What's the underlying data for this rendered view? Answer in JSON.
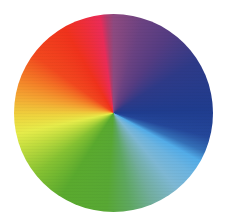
{
  "image": {
    "description": "Conic color wheel",
    "background_color": "#ffffff"
  },
  "wheel": {
    "shape": "circle",
    "center": [
      114,
      113
    ],
    "diameter": 198,
    "color_stops": [
      {
        "angle_deg": 0,
        "color": "#8e4a80",
        "name": "mauve"
      },
      {
        "angle_deg": 35,
        "color": "#553c82",
        "name": "purple"
      },
      {
        "angle_deg": 88,
        "color": "#1f3c8e",
        "name": "navy blue"
      },
      {
        "angle_deg": 119,
        "color": "#52ace8",
        "name": "sky blue"
      },
      {
        "angle_deg": 140,
        "color": "#7eb8d4",
        "name": "light blue"
      },
      {
        "angle_deg": 184,
        "color": "#58a834",
        "name": "green"
      },
      {
        "angle_deg": 232,
        "color": "#86c232",
        "name": "lime green"
      },
      {
        "angle_deg": 258,
        "color": "#e6ec4a",
        "name": "yellow"
      },
      {
        "angle_deg": 280,
        "color": "#f4a632",
        "name": "orange"
      },
      {
        "angle_deg": 306,
        "color": "#f2481e",
        "name": "red-orange"
      },
      {
        "angle_deg": 330,
        "color": "#f0321c",
        "name": "red"
      },
      {
        "angle_deg": 352,
        "color": "#ea2c58",
        "name": "pink"
      }
    ]
  }
}
